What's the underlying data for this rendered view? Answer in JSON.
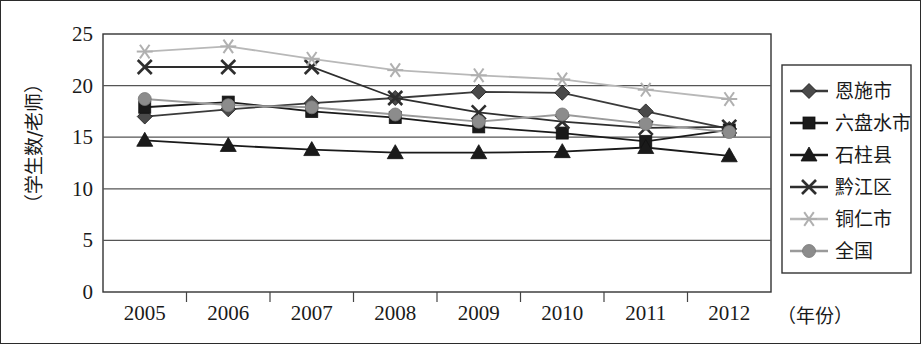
{
  "chart_data": {
    "type": "line",
    "title": "",
    "xlabel": "（年份）",
    "ylabel": "（学生数/老师）",
    "categories": [
      "2005",
      "2006",
      "2007",
      "2008",
      "2009",
      "2010",
      "2011",
      "2012"
    ],
    "ylim": [
      0,
      25
    ],
    "yticks": [
      0,
      5,
      10,
      15,
      20,
      25
    ],
    "ytick_labels": [
      "0",
      "5",
      "10",
      "15",
      "20",
      "25"
    ],
    "grid": true,
    "legend_position": "right",
    "series": [
      {
        "name": "恩施市",
        "marker": "diamond",
        "color": "#4a4a4a",
        "line_color": "#3a3a3a",
        "values": [
          17.0,
          17.7,
          18.3,
          18.8,
          19.4,
          19.3,
          17.5,
          15.8
        ]
      },
      {
        "name": "六盘水市",
        "marker": "square",
        "color": "#1a1a1a",
        "line_color": "#1a1a1a",
        "values": [
          17.9,
          18.4,
          17.5,
          16.9,
          16.0,
          15.4,
          14.6,
          15.7
        ]
      },
      {
        "name": "石柱县",
        "marker": "triangle",
        "color": "#1a1a1a",
        "line_color": "#1a1a1a",
        "values": [
          14.7,
          14.2,
          13.8,
          13.5,
          13.5,
          13.6,
          14.0,
          13.2
        ]
      },
      {
        "name": "黔江区",
        "marker": "cross",
        "color": "#2e2e2e",
        "line_color": "#2e2e2e",
        "values": [
          21.8,
          21.8,
          21.8,
          18.8,
          17.4,
          16.5,
          15.9,
          16.0
        ]
      },
      {
        "name": "铜仁市",
        "marker": "asterisk",
        "color": "#b0b0b0",
        "line_color": "#b8b8b8",
        "values": [
          23.3,
          23.8,
          22.6,
          21.5,
          21.0,
          20.6,
          19.6,
          18.7
        ]
      },
      {
        "name": "全国",
        "marker": "circle",
        "color": "#8c8c8c",
        "line_color": "#9a9a9a",
        "values": [
          18.7,
          18.1,
          17.9,
          17.2,
          16.5,
          17.2,
          16.3,
          15.5
        ]
      }
    ]
  },
  "legend": {
    "items": [
      {
        "label": "恩施市"
      },
      {
        "label": "六盘水市"
      },
      {
        "label": "石柱县"
      },
      {
        "label": "黔江区"
      },
      {
        "label": "铜仁市"
      },
      {
        "label": "全国"
      }
    ]
  }
}
